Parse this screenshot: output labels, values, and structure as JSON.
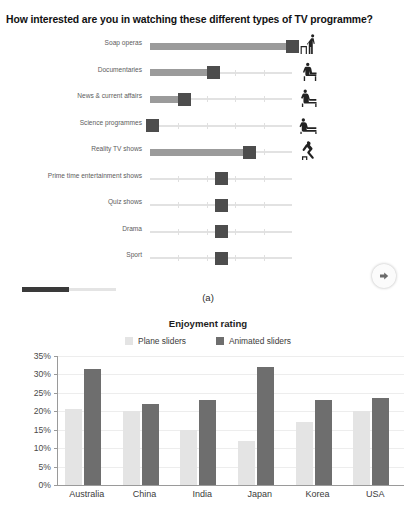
{
  "panel_a": {
    "question_title": "How interested are you in watching these different types of TV programme?",
    "caption": "(a)",
    "next_button_icon": "arrow-right-icon",
    "progress_percent": 50,
    "sliders": [
      {
        "label": "Soap operas",
        "value": 100,
        "filled": true,
        "figure": "person-standing-icon"
      },
      {
        "label": "Documentaries",
        "value": 45,
        "filled": true,
        "figure": "person-sitting-upright-icon"
      },
      {
        "label": "News & current affairs",
        "value": 24,
        "filled": true,
        "figure": "person-leaning-icon"
      },
      {
        "label": "Science programmes",
        "value": 2,
        "filled": true,
        "figure": "person-reclining-icon"
      },
      {
        "label": "Reality TV shows",
        "value": 70,
        "filled": true,
        "figure": "person-slouching-icon"
      },
      {
        "label": "Prime time entertainment shows",
        "value": 50,
        "filled": false,
        "figure": ""
      },
      {
        "label": "Quiz shows",
        "value": 50,
        "filled": false,
        "figure": ""
      },
      {
        "label": "Drama",
        "value": 50,
        "filled": false,
        "figure": ""
      },
      {
        "label": "Sport",
        "value": 50,
        "filled": false,
        "figure": ""
      }
    ]
  },
  "colors": {
    "plane_sliders": "#e4e4e4",
    "animated_sliders": "#6e6e6e",
    "slider_fill": "#9b9b9b",
    "slider_handle": "#4d4d4d",
    "axis": "#9a9a9a"
  },
  "chart_data": {
    "type": "bar",
    "title": "Enjoyment rating",
    "xlabel": "",
    "ylabel": "",
    "ylim": [
      0,
      35
    ],
    "ytick_labels": [
      "0%",
      "5%",
      "10%",
      "15%",
      "20%",
      "25%",
      "30%",
      "35%"
    ],
    "ytick_values": [
      0,
      5,
      10,
      15,
      20,
      25,
      30,
      35
    ],
    "grid": true,
    "legend_position": "top-center",
    "categories": [
      "Australia",
      "China",
      "India",
      "Japan",
      "Korea",
      "USA"
    ],
    "series": [
      {
        "name": "Plane sliders",
        "color": "#e4e4e4",
        "values": [
          20.5,
          20.0,
          15.0,
          12.0,
          17.0,
          20.0
        ]
      },
      {
        "name": "Animated sliders",
        "color": "#6e6e6e",
        "values": [
          31.5,
          22.0,
          23.0,
          32.0,
          23.0,
          23.5
        ]
      }
    ]
  }
}
